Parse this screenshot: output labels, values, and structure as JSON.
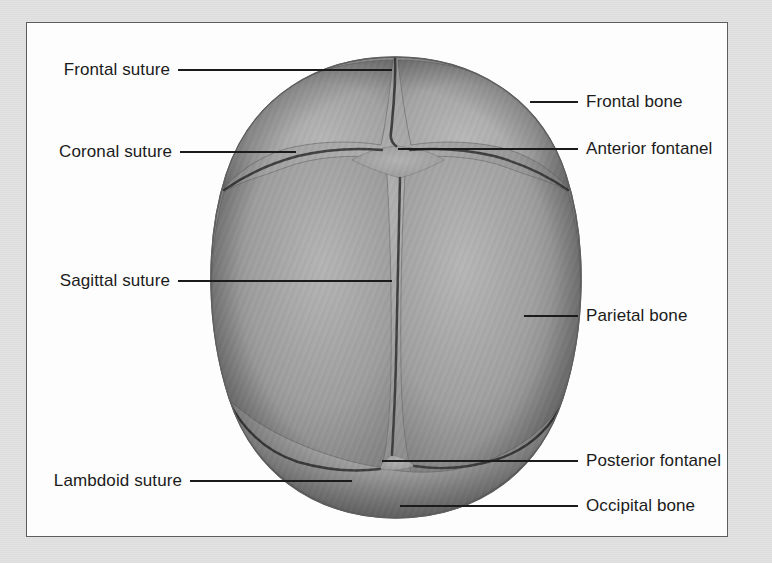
{
  "figure": {
    "background_color": "#e2e2e2",
    "panel_color": "#fdfdfd",
    "panel_border_color": "#5d5d5d",
    "leader_line_color": "#1b1b1b",
    "text_color": "#1b1b1b",
    "bone_fill_color": "#9a9a9a",
    "bone_shadow_color": "#6a6a6a",
    "suture_color": "#4a4a4a",
    "fontanel_fill_color": "#a6a6a6"
  },
  "labels": {
    "left": [
      {
        "id": "frontal-suture",
        "text": "Frontal suture",
        "text_x": 170,
        "text_y": 70,
        "line_x1": 178,
        "line_x2": 392,
        "line_y": 70
      },
      {
        "id": "coronal-suture",
        "text": "Coronal suture",
        "text_x": 172,
        "text_y": 152,
        "line_x1": 180,
        "line_x2": 296,
        "line_y": 152
      },
      {
        "id": "sagittal-suture",
        "text": "Sagittal suture",
        "text_x": 170,
        "text_y": 281,
        "line_x1": 178,
        "line_x2": 392,
        "line_y": 281
      },
      {
        "id": "lambdoid-suture",
        "text": "Lambdoid suture",
        "text_x": 182,
        "text_y": 481,
        "line_x1": 190,
        "line_x2": 352,
        "line_y": 481
      }
    ],
    "right": [
      {
        "id": "frontal-bone",
        "text": "Frontal bone",
        "text_x": 586,
        "text_y": 102,
        "line_x1": 530,
        "line_x2": 578,
        "line_y": 102
      },
      {
        "id": "anterior-fontanel",
        "text": "Anterior fontanel",
        "text_x": 586,
        "text_y": 149,
        "line_x1": 398,
        "line_x2": 578,
        "line_y": 149
      },
      {
        "id": "parietal-bone",
        "text": "Parietal bone",
        "text_x": 586,
        "text_y": 316,
        "line_x1": 524,
        "line_x2": 578,
        "line_y": 316
      },
      {
        "id": "posterior-fontanel",
        "text": "Posterior fontanel",
        "text_x": 586,
        "text_y": 461,
        "line_x1": 382,
        "line_x2": 578,
        "line_y": 461
      },
      {
        "id": "occipital-bone",
        "text": "Occipital bone",
        "text_x": 586,
        "text_y": 506,
        "line_x1": 400,
        "line_x2": 578,
        "line_y": 506
      }
    ]
  },
  "anatomy": {
    "structures": [
      "Frontal bone (left half)",
      "Frontal bone (right half)",
      "Parietal bone (left)",
      "Parietal bone (right)",
      "Occipital bone",
      "Frontal (metopic) suture",
      "Coronal suture",
      "Sagittal suture",
      "Lambdoid suture",
      "Anterior fontanel",
      "Posterior fontanel"
    ]
  }
}
